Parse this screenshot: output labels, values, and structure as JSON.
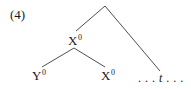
{
  "example": {
    "number": "(4)"
  },
  "tree": {
    "root": {
      "label": ""
    },
    "nodes": [
      {
        "id": "x0-mid",
        "base": "X",
        "superscript": "0"
      },
      {
        "id": "y0-leaf",
        "base": "Y",
        "superscript": "0"
      },
      {
        "id": "x0-leaf",
        "base": "X",
        "superscript": "0"
      }
    ],
    "trace": {
      "prefix": ". . . ",
      "symbol": "t",
      "suffix": " . . ."
    },
    "edges": [
      {
        "from": "root",
        "to": "x0-mid"
      },
      {
        "from": "root",
        "to": "trace"
      },
      {
        "from": "x0-mid",
        "to": "y0-leaf"
      },
      {
        "from": "x0-mid",
        "to": "x0-leaf"
      }
    ]
  },
  "colors": {
    "line": "#3a3a3a",
    "text": "#1a1a1a",
    "background": "#ffffff"
  }
}
